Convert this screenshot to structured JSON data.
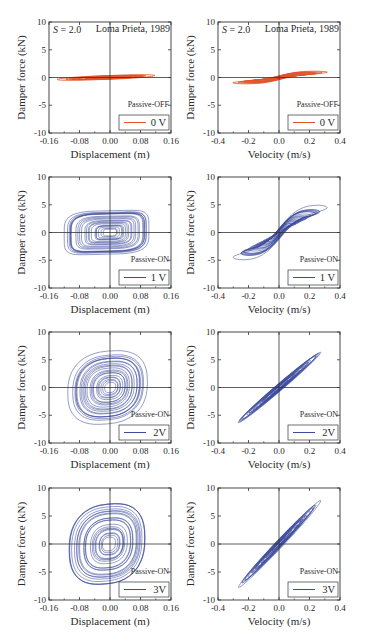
{
  "figure": {
    "earthquake_label": "Loma Prieta, 1989",
    "scale_label": "S = 2.0",
    "scale_symbol": "S",
    "scale_value": "= 2.0",
    "colors": {
      "off": "#e0542a",
      "on": "#3b4a9a",
      "axis": "#222222"
    }
  },
  "chart_data": [
    {
      "id": "r1c1",
      "type": "line",
      "title": "",
      "xlabel": "Displacement (m)",
      "ylabel": "Damper force (kN)",
      "xlim": [
        -0.16,
        0.16
      ],
      "ylim": [
        -10,
        10
      ],
      "xticks": [
        "-0.16",
        "-0.08",
        "0.00",
        "0.08",
        "0.16"
      ],
      "yticks": [
        "10",
        "5",
        "0",
        "-5",
        "-10"
      ],
      "mode": "Passive-OFF",
      "legend": "0 V",
      "color": "#e0542a",
      "annotations": [
        "S = 2.0",
        "Loma Prieta, 1989"
      ],
      "description": "Narrow hysteresis band, force approx -1 to +1 kN over displacement -0.15 to 0.11 m",
      "series": [
        {
          "name": "0 V",
          "x_range": [
            -0.15,
            0.11
          ],
          "y_range": [
            -1.1,
            1.0
          ]
        }
      ]
    },
    {
      "id": "r1c2",
      "type": "line",
      "title": "",
      "xlabel": "Velocity (m/s)",
      "ylabel": "Damper force (kN)",
      "xlim": [
        -0.4,
        0.4
      ],
      "ylim": [
        -10,
        10
      ],
      "xticks": [
        "-0.4",
        "-0.2",
        "0.0",
        "0.2",
        "0.4"
      ],
      "yticks": [
        "10",
        "5",
        "0",
        "-5",
        "-10"
      ],
      "mode": "Passive-OFF",
      "legend": "0 V",
      "color": "#e0542a",
      "annotations": [
        "S = 2.0",
        "Loma Prieta, 1989"
      ],
      "series": [
        {
          "name": "0 V",
          "x_range": [
            -0.33,
            0.35
          ],
          "y_range": [
            -1.1,
            1.0
          ]
        }
      ]
    },
    {
      "id": "r2c1",
      "type": "line",
      "xlabel": "Displacement (m)",
      "ylabel": "Damper force (kN)",
      "xlim": [
        -0.16,
        0.16
      ],
      "ylim": [
        -10,
        10
      ],
      "xticks": [
        "-0.16",
        "-0.08",
        "0.00",
        "0.08",
        "0.16"
      ],
      "yticks": [
        "10",
        "5",
        "0",
        "-5",
        "-10"
      ],
      "mode": "Passive-ON",
      "legend": "1 V",
      "color": "#3b4a9a",
      "series": [
        {
          "name": "1 V",
          "x_range": [
            -0.14,
            0.11
          ],
          "y_range": [
            -4.5,
            4.3
          ]
        }
      ]
    },
    {
      "id": "r2c2",
      "type": "line",
      "xlabel": "Velocity (m/s)",
      "ylabel": "Damper force (kN)",
      "xlim": [
        -0.4,
        0.4
      ],
      "ylim": [
        -10,
        10
      ],
      "xticks": [
        "-0.4",
        "-0.2",
        "0.0",
        "0.2",
        "0.4"
      ],
      "yticks": [
        "10",
        "5",
        "0",
        "-5",
        "-10"
      ],
      "mode": "Passive-ON",
      "legend": "1 V",
      "color": "#3b4a9a",
      "series": [
        {
          "name": "1 V",
          "x_range": [
            -0.3,
            0.32
          ],
          "y_range": [
            -4.7,
            4.3
          ]
        }
      ]
    },
    {
      "id": "r3c1",
      "type": "line",
      "xlabel": "Displacement (m)",
      "ylabel": "Damper force (kN)",
      "xlim": [
        -0.16,
        0.16
      ],
      "ylim": [
        -10,
        10
      ],
      "xticks": [
        "-0.16",
        "-0.08",
        "0.00",
        "0.08",
        "0.16"
      ],
      "yticks": [
        "10",
        "5",
        "0",
        "-5",
        "-10"
      ],
      "mode": "Passive-ON",
      "legend": "2V",
      "color": "#3b4a9a",
      "series": [
        {
          "name": "2V",
          "x_range": [
            -0.12,
            0.1
          ],
          "y_range": [
            -7.0,
            6.8
          ]
        }
      ]
    },
    {
      "id": "r3c2",
      "type": "line",
      "xlabel": "Velocity (m/s)",
      "ylabel": "Damper force (kN)",
      "xlim": [
        -0.4,
        0.4
      ],
      "ylim": [
        -10,
        10
      ],
      "xticks": [
        "-0.4",
        "-0.2",
        "0.0",
        "0.2",
        "0.4"
      ],
      "yticks": [
        "10",
        "5",
        "0",
        "-5",
        "-10"
      ],
      "mode": "Passive-ON",
      "legend": "2V",
      "color": "#3b4a9a",
      "series": [
        {
          "name": "2V",
          "x_range": [
            -0.3,
            0.3
          ],
          "y_range": [
            -7.2,
            6.8
          ]
        }
      ]
    },
    {
      "id": "r4c1",
      "type": "line",
      "xlabel": "Displacement (m)",
      "ylabel": "Damper force (kN)",
      "xlim": [
        -0.16,
        0.16
      ],
      "ylim": [
        -10,
        10
      ],
      "xticks": [
        "-0.16",
        "-0.08",
        "0.00",
        "0.08",
        "0.16"
      ],
      "yticks": [
        "10",
        "5",
        "0",
        "-5",
        "-10"
      ],
      "mode": "Passive-ON",
      "legend": "3V",
      "color": "#3b4a9a",
      "series": [
        {
          "name": "3V",
          "x_range": [
            -0.13,
            0.1
          ],
          "y_range": [
            -8.5,
            8.0
          ]
        }
      ]
    },
    {
      "id": "r4c2",
      "type": "line",
      "xlabel": "Velocity (m/s)",
      "ylabel": "Damper force (kN)",
      "xlim": [
        -0.4,
        0.4
      ],
      "ylim": [
        -10,
        10
      ],
      "xticks": [
        "-0.4",
        "-0.2",
        "0.0",
        "0.2",
        "0.4"
      ],
      "yticks": [
        "10",
        "5",
        "0",
        "-5",
        "-10"
      ],
      "mode": "Passive-ON",
      "legend": "3V",
      "color": "#3b4a9a",
      "series": [
        {
          "name": "3V",
          "x_range": [
            -0.28,
            0.28
          ],
          "y_range": [
            -8.2,
            7.8
          ]
        }
      ]
    }
  ]
}
